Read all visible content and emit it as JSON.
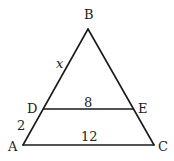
{
  "figure": {
    "type": "triangle-with-parallel-segment",
    "stroke_color": "#1a1a1a",
    "text_color": "#222222",
    "vertices": {
      "A": {
        "label": "A",
        "x": 23,
        "y": 145
      },
      "B": {
        "label": "B",
        "x": 88,
        "y": 29
      },
      "C": {
        "label": "C",
        "x": 154,
        "y": 145
      },
      "D": {
        "label": "D",
        "x": 44,
        "y": 109
      },
      "E": {
        "label": "E",
        "x": 133,
        "y": 109
      }
    },
    "segments": [
      {
        "from": "A",
        "to": "B"
      },
      {
        "from": "B",
        "to": "C"
      },
      {
        "from": "A",
        "to": "C"
      },
      {
        "from": "D",
        "to": "E"
      }
    ],
    "measure_labels": {
      "BD": "x",
      "DA": "2",
      "DE": "8",
      "AC": "12"
    }
  }
}
